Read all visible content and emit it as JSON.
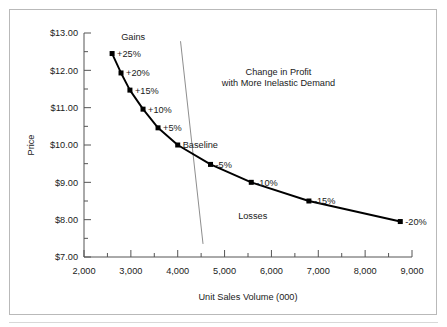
{
  "chart_data": {
    "type": "line",
    "title_line1": "Change in Profit",
    "title_line2": "with More Inelastic Demand",
    "xlabel": "Unit Sales Volume (000)",
    "ylabel": "Price",
    "xlim": [
      2000,
      9000
    ],
    "ylim": [
      7.0,
      13.0
    ],
    "x_major_step": 1000,
    "x_minor_step": 500,
    "y_major_step": 1.0,
    "y_minor_step": 0.5,
    "grid": false,
    "legend": null,
    "xtick_labels": [
      "2,000",
      "3,000",
      "4,000",
      "5,000",
      "6,000",
      "7,000",
      "8,000",
      "9,000"
    ],
    "xtick_values": [
      2000,
      3000,
      4000,
      5000,
      6000,
      7000,
      8000,
      9000
    ],
    "ytick_labels": [
      "$7.00",
      "$8.00",
      "$9.00",
      "$10.00",
      "$11.00",
      "$12.00",
      "$13.00"
    ],
    "ytick_values": [
      7.0,
      8.0,
      9.0,
      10.0,
      11.0,
      12.0,
      13.0
    ],
    "series": [
      {
        "name": "Demand curve",
        "marker": "square",
        "color": "#000000",
        "x": [
          2600,
          2790,
          2980,
          3260,
          3580,
          4000,
          4700,
          5570,
          6800,
          8750
        ],
        "y": [
          12.45,
          11.93,
          11.47,
          10.96,
          10.46,
          10.0,
          9.48,
          9.0,
          8.5,
          7.95
        ],
        "point_labels": [
          "+25%",
          "+20%",
          "+15%",
          "+10%",
          "+5%",
          "Baseline",
          "-5%",
          "-10%",
          "-15%",
          "-20%"
        ]
      }
    ],
    "reference_line": {
      "name": "iso-profit line",
      "color": "#808080",
      "x": [
        4060,
        4540
      ],
      "y": [
        12.78,
        7.35
      ]
    },
    "annotations": [
      {
        "text": "Gains",
        "x": 3050,
        "y": 12.8
      },
      {
        "text": "Losses",
        "x": 5600,
        "y": 8.03
      },
      {
        "text": "Change in Profit",
        "x": 6150,
        "y": 11.87
      },
      {
        "text": "with More Inelastic Demand",
        "x": 6150,
        "y": 11.58
      }
    ]
  },
  "colors": {
    "line": "#000000",
    "marker": "#000000",
    "reference_line": "#808080",
    "axis": "#555555",
    "text": "#1a1a1a",
    "border": "#b9b9b9",
    "background": "#ffffff"
  }
}
